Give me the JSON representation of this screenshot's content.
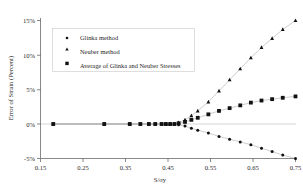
{
  "chart_data": {
    "type": "scatter",
    "title": "",
    "xlabel": "S/σy",
    "ylabel": "Error of Strain (Percent)",
    "xlim": [
      0.15,
      0.75
    ],
    "ylim": [
      -5,
      15
    ],
    "xticks": [
      "0.15",
      "0.25",
      "0.35",
      "0.45",
      "0.55",
      "0.65",
      "0.75"
    ],
    "xtick_values": [
      0.15,
      0.25,
      0.35,
      0.45,
      0.55,
      0.65,
      0.75
    ],
    "yticks": [
      "15%",
      "10%",
      "5%",
      "0%",
      "-5%"
    ],
    "ytick_values": [
      15,
      10,
      5,
      0,
      -5
    ],
    "grid": false,
    "legend_position": "upper-left",
    "series": [
      {
        "name": "Glinka method",
        "marker": "small-dot",
        "x": [
          0.18,
          0.3,
          0.36,
          0.385,
          0.405,
          0.42,
          0.435,
          0.445,
          0.455,
          0.465,
          0.475,
          0.49,
          0.505,
          0.52,
          0.545,
          0.57,
          0.595,
          0.62,
          0.645,
          0.67,
          0.695,
          0.72,
          0.75
        ],
        "values": [
          0,
          0,
          0,
          0,
          0,
          0,
          0,
          0,
          0,
          0,
          -0.1,
          -0.3,
          -0.6,
          -0.9,
          -1.3,
          -1.8,
          -2.2,
          -2.6,
          -3.0,
          -3.5,
          -4.0,
          -4.5,
          -5.0
        ]
      },
      {
        "name": "Neuber method",
        "marker": "triangle",
        "x": [
          0.18,
          0.3,
          0.36,
          0.385,
          0.405,
          0.42,
          0.435,
          0.445,
          0.455,
          0.465,
          0.475,
          0.49,
          0.505,
          0.52,
          0.545,
          0.57,
          0.595,
          0.62,
          0.645,
          0.67,
          0.695,
          0.72,
          0.75
        ],
        "values": [
          0,
          0,
          0,
          0,
          0,
          0,
          0,
          0,
          0,
          0,
          0.2,
          0.6,
          1.2,
          1.9,
          3.2,
          4.8,
          6.4,
          8.0,
          9.6,
          11.1,
          12.4,
          13.7,
          15.0
        ]
      },
      {
        "name": "Average of Glinka and Neuber Stresses",
        "marker": "square",
        "x": [
          0.18,
          0.3,
          0.36,
          0.385,
          0.405,
          0.42,
          0.435,
          0.445,
          0.455,
          0.465,
          0.475,
          0.49,
          0.505,
          0.52,
          0.545,
          0.57,
          0.595,
          0.62,
          0.645,
          0.67,
          0.695,
          0.72,
          0.75
        ],
        "values": [
          0,
          0,
          0,
          0,
          0,
          0,
          0,
          0,
          0,
          0,
          0.1,
          0.3,
          0.6,
          0.9,
          1.4,
          1.9,
          2.3,
          2.7,
          3.1,
          3.4,
          3.6,
          3.8,
          4.0
        ]
      }
    ]
  },
  "legend": {
    "entries": [
      {
        "label": "Glinka method",
        "marker": "small-dot"
      },
      {
        "label": "Neuber method",
        "marker": "triangle"
      },
      {
        "label": "Average of Glinka and Neuber Stresses",
        "marker": "square"
      }
    ]
  },
  "colors": {
    "marker": "#111111",
    "frame": "#555555",
    "zero_line": "#b9b9b9",
    "legend_border": "#c9c9c9",
    "background": "#ffffff"
  }
}
